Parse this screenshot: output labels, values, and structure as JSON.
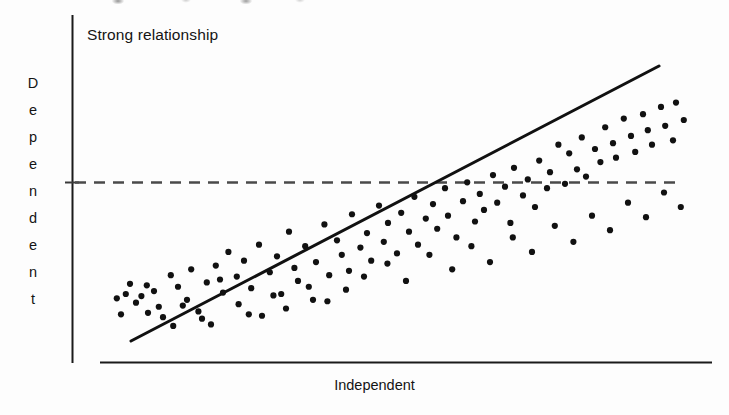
{
  "figure": {
    "title": "Strong relationship",
    "xlabel": "Independent",
    "ylabel": "Dependent",
    "ylabel_letters": [
      "D",
      "e",
      "p",
      "e",
      "n",
      "d",
      "e",
      "n",
      "t"
    ]
  },
  "colors": {
    "background": "#fdfdfd",
    "axis": "#1a1a1a",
    "point": "#111111",
    "trend_line": "#111111",
    "reference_line": "#4a4a4a"
  },
  "chart_data": {
    "type": "scatter",
    "title": "Strong relationship",
    "xlabel": "Independent",
    "ylabel": "Dependent",
    "grid": false,
    "legend": null,
    "xlim": [
      0,
      100
    ],
    "ylim": [
      0,
      100
    ],
    "axis_ticks": [],
    "annotations": [
      {
        "type": "reference-line",
        "orientation": "horizontal",
        "style": "dashed",
        "y": 50,
        "x_start": 0,
        "x_end": 100,
        "label": ""
      },
      {
        "type": "trend-line",
        "style": "solid",
        "x_start": 5,
        "y_start": 6,
        "x_end": 92,
        "y_end": 85,
        "description": "least squares fit, strong positive slope"
      }
    ],
    "n_points": 130,
    "points": [
      [
        4.3,
        20.0
      ],
      [
        5.0,
        23.5
      ],
      [
        6.9,
        19.3
      ],
      [
        7.8,
        23.0
      ],
      [
        9.8,
        15.6
      ],
      [
        8.0,
        13.5
      ],
      [
        10.5,
        12.0
      ],
      [
        11.8,
        26.5
      ],
      [
        13.0,
        22.5
      ],
      [
        12.2,
        9.0
      ],
      [
        14.5,
        18.0
      ],
      [
        15.2,
        28.5
      ],
      [
        16.4,
        14.0
      ],
      [
        17.8,
        24.0
      ],
      [
        18.5,
        9.5
      ],
      [
        19.3,
        29.8
      ],
      [
        20.5,
        20.5
      ],
      [
        21.4,
        34.5
      ],
      [
        22.8,
        26.0
      ],
      [
        23.1,
        16.5
      ],
      [
        24.0,
        31.5
      ],
      [
        25.2,
        22.0
      ],
      [
        26.5,
        37.0
      ],
      [
        27.0,
        12.5
      ],
      [
        28.3,
        27.5
      ],
      [
        29.5,
        33.0
      ],
      [
        30.2,
        20.0
      ],
      [
        31.5,
        41.5
      ],
      [
        32.4,
        29.0
      ],
      [
        33.0,
        24.5
      ],
      [
        34.2,
        36.5
      ],
      [
        35.5,
        18.0
      ],
      [
        36.0,
        31.0
      ],
      [
        37.4,
        44.0
      ],
      [
        38.2,
        26.5
      ],
      [
        39.5,
        38.5
      ],
      [
        40.3,
        33.5
      ],
      [
        41.5,
        28.0
      ],
      [
        42.0,
        47.5
      ],
      [
        43.4,
        36.0
      ],
      [
        44.5,
        41.0
      ],
      [
        45.2,
        31.5
      ],
      [
        46.5,
        50.5
      ],
      [
        47.3,
        38.0
      ],
      [
        48.0,
        44.5
      ],
      [
        49.5,
        34.0
      ],
      [
        50.2,
        48.0
      ],
      [
        51.5,
        41.5
      ],
      [
        52.4,
        53.5
      ],
      [
        53.0,
        37.0
      ],
      [
        54.3,
        46.0
      ],
      [
        55.5,
        51.0
      ],
      [
        56.2,
        42.5
      ],
      [
        57.5,
        56.5
      ],
      [
        58.0,
        47.0
      ],
      [
        59.4,
        39.5
      ],
      [
        60.5,
        52.0
      ],
      [
        61.2,
        58.5
      ],
      [
        62.5,
        45.0
      ],
      [
        63.3,
        54.5
      ],
      [
        64.0,
        49.0
      ],
      [
        65.5,
        61.0
      ],
      [
        66.2,
        51.5
      ],
      [
        67.5,
        57.0
      ],
      [
        68.4,
        44.5
      ],
      [
        69.0,
        63.5
      ],
      [
        70.5,
        54.0
      ],
      [
        71.3,
        59.5
      ],
      [
        72.5,
        50.0
      ],
      [
        73.2,
        66.0
      ],
      [
        74.5,
        56.5
      ],
      [
        75.0,
        62.0
      ],
      [
        76.4,
        71.5
      ],
      [
        77.5,
        58.0
      ],
      [
        78.2,
        68.5
      ],
      [
        79.5,
        63.0
      ],
      [
        80.3,
        74.0
      ],
      [
        81.0,
        60.5
      ],
      [
        82.5,
        70.0
      ],
      [
        83.4,
        65.5
      ],
      [
        84.2,
        77.5
      ],
      [
        85.5,
        72.0
      ],
      [
        86.0,
        67.0
      ],
      [
        87.3,
        80.5
      ],
      [
        88.5,
        74.5
      ],
      [
        89.2,
        69.0
      ],
      [
        90.5,
        82.0
      ],
      [
        91.3,
        76.5
      ],
      [
        92.0,
        71.5
      ],
      [
        93.5,
        84.5
      ],
      [
        94.2,
        78.0
      ],
      [
        95.5,
        73.0
      ],
      [
        96.0,
        86.0
      ],
      [
        97.3,
        80.0
      ],
      [
        6.0,
        17.0
      ],
      [
        9.0,
        21.0
      ],
      [
        13.8,
        16.0
      ],
      [
        17.0,
        11.5
      ],
      [
        20.0,
        25.0
      ],
      [
        24.8,
        13.0
      ],
      [
        28.9,
        19.5
      ],
      [
        31.0,
        15.0
      ],
      [
        34.8,
        22.5
      ],
      [
        37.9,
        17.5
      ],
      [
        41.0,
        21.5
      ],
      [
        44.0,
        26.0
      ],
      [
        47.9,
        30.5
      ],
      [
        51.0,
        24.5
      ],
      [
        54.9,
        33.5
      ],
      [
        58.7,
        28.5
      ],
      [
        61.9,
        36.5
      ],
      [
        65.0,
        31.0
      ],
      [
        68.8,
        39.5
      ],
      [
        72.0,
        34.5
      ],
      [
        75.8,
        43.5
      ],
      [
        78.9,
        38.0
      ],
      [
        82.0,
        47.0
      ],
      [
        85.0,
        42.0
      ],
      [
        88.0,
        51.5
      ],
      [
        91.0,
        46.5
      ],
      [
        94.0,
        55.0
      ],
      [
        96.8,
        50.0
      ],
      [
        3.5,
        13.0
      ],
      [
        2.8,
        18.5
      ]
    ]
  }
}
